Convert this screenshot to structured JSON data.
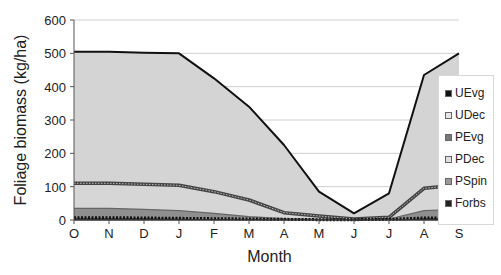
{
  "chart_data": {
    "type": "area",
    "title": "",
    "xlabel": "Month",
    "ylabel": "Foliage biomass (kg/ha)",
    "ylim": [
      0,
      600
    ],
    "yticks": [
      0,
      100,
      200,
      300,
      400,
      500,
      600
    ],
    "grid": true,
    "legend_position": "right",
    "categories": [
      "O",
      "N",
      "D",
      "J",
      "F",
      "M",
      "A",
      "M",
      "J",
      "J",
      "A",
      "S"
    ],
    "stacked_cumulative_top": {
      "UDec": [
        505,
        505,
        502,
        500,
        425,
        340,
        225,
        85,
        20,
        80,
        435,
        500
      ],
      "PDec": [
        110,
        110,
        107,
        104,
        85,
        60,
        22,
        12,
        3,
        8,
        95,
        105
      ],
      "PSpin": [
        35,
        35,
        32,
        28,
        20,
        10,
        4,
        2,
        1,
        3,
        28,
        32
      ],
      "Forbs": [
        7,
        7,
        6,
        5,
        4,
        3,
        2,
        1,
        1,
        2,
        6,
        7
      ]
    },
    "series": [
      {
        "name": "UEvg",
        "values": [
          0,
          0,
          0,
          0,
          0,
          0,
          0,
          0,
          0,
          0,
          0,
          0
        ],
        "color": "#111111"
      },
      {
        "name": "UDec",
        "values": [
          395,
          395,
          395,
          396,
          340,
          280,
          203,
          73,
          17,
          72,
          340,
          395
        ],
        "color": "#d4d4d4"
      },
      {
        "name": "PEvg",
        "values": [
          0,
          0,
          0,
          0,
          0,
          0,
          0,
          0,
          0,
          0,
          0,
          0
        ],
        "color": "#777777"
      },
      {
        "name": "PDec",
        "values": [
          75,
          75,
          75,
          76,
          65,
          50,
          18,
          10,
          2,
          5,
          67,
          73
        ],
        "color": "#d9d9d9"
      },
      {
        "name": "PSpin",
        "values": [
          28,
          28,
          26,
          23,
          16,
          7,
          2,
          1,
          0,
          1,
          22,
          25
        ],
        "color": "#999999"
      },
      {
        "name": "Forbs",
        "values": [
          7,
          7,
          6,
          5,
          4,
          3,
          2,
          1,
          1,
          2,
          6,
          7
        ],
        "color": "#333333"
      }
    ]
  },
  "axis": {
    "y_ticks": [
      "0",
      "100",
      "200",
      "300",
      "400",
      "500",
      "600"
    ],
    "x_ticks": [
      "O",
      "N",
      "D",
      "J",
      "F",
      "M",
      "A",
      "M",
      "J",
      "J",
      "A",
      "S"
    ],
    "xlabel": "Month",
    "ylabel": "Foliage biomass (kg/ha)"
  },
  "legend": [
    {
      "label": "UEvg",
      "color": "#111111"
    },
    {
      "label": "UDec",
      "color": "#e6e6e6"
    },
    {
      "label": "PEvg",
      "color": "#777777"
    },
    {
      "label": "PDec",
      "color": "#e0e0e0"
    },
    {
      "label": "PSpin",
      "color": "#999999"
    },
    {
      "label": "Forbs",
      "color": "#222222"
    }
  ]
}
